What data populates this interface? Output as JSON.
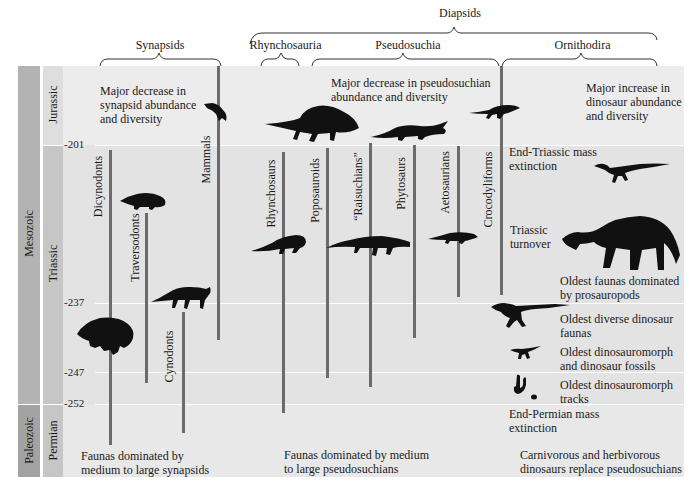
{
  "title_fragment": "",
  "clades": {
    "diapsids": "Diapsids",
    "synapsids": "Synapsids",
    "rhynchosauria": "Rhynchosauria",
    "pseudosuchia": "Pseudosuchia",
    "ornithodira": "Ornithodira"
  },
  "timescale": {
    "eras": [
      {
        "name": "Mesozoic",
        "color": "#b3b3b3"
      },
      {
        "name": "Paleozoic",
        "color": "#a3a3a3"
      }
    ],
    "periods": [
      {
        "name": "Jurassic",
        "color": "#dedede"
      },
      {
        "name": "Triassic",
        "color": "#c6c6c6"
      },
      {
        "name": "Permian",
        "color": "#c6c6c6"
      }
    ],
    "ticks": [
      "201",
      "237",
      "247",
      "252"
    ],
    "units": "Ma"
  },
  "lineages": [
    {
      "name": "Dicynodonts"
    },
    {
      "name": "Traversodonts"
    },
    {
      "name": "Cynodonts"
    },
    {
      "name": "Mammals"
    },
    {
      "name": "Rhynchosaurs"
    },
    {
      "name": "Poposauroids"
    },
    {
      "name": "“Raisuchians”"
    },
    {
      "name": "Phytosaurs"
    },
    {
      "name": "Aetosaurians"
    },
    {
      "name": "Crocodyliforms"
    }
  ],
  "notes": {
    "synapsid_decrease": "Major decrease in synapsid abundance and diversity",
    "pseudosuchian_decrease": "Major decrease in pseudosuchian abundance and diversity",
    "dinosaur_increase": "Major increase in dinosaur abundance and diversity",
    "end_triassic": "End-Triassic mass extinction",
    "triassic_turnover": "Triassic turnover",
    "prosauropods": "Oldest faunas dominated by prosauropods",
    "diverse_dinosaur": "Oldest diverse dinosaur faunas",
    "dinosauromorph_fossils": "Oldest dinosauromorph and dinosaur fossils",
    "dinosauromorph_tracks": "Oldest dinosauromorph tracks",
    "end_permian": "End-Permian mass extinction",
    "faunas_synapsids": "Faunas dominated by medium to large synapsids",
    "faunas_pseudosuchians": "Faunas dominated by medium to large pseudosuchians",
    "dinosaurs_replace": "Carnivorous and herbivorous dinosaurs replace pseudosuchians"
  },
  "colors": {
    "band_jurassic": "#ececec",
    "band_triassic": "#e3e3e3",
    "band_permian": "#e8e8e8",
    "bar": "#6b6b6b",
    "silhouette": "#111111"
  }
}
